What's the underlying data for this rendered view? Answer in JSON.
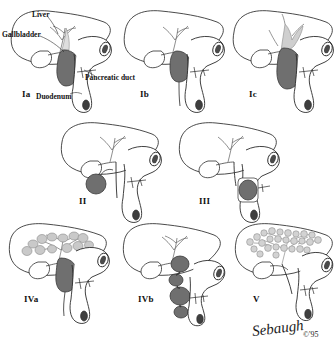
{
  "figure": {
    "colors": {
      "ink": "#2b2b2b",
      "paper": "#ffffff",
      "cyst_dark": "#6f6f6f",
      "cyst_mid": "#8c8c8c",
      "cyst_light": "#c9c9c9",
      "duct_light": "#d8d8d8",
      "liver_fill": "#ffffff"
    }
  },
  "anatomy_labels": [
    {
      "id": "liver",
      "text": "Liver",
      "x": 32,
      "y": 11
    },
    {
      "id": "gallbladder",
      "text": "Gallbladder",
      "x": 2,
      "y": 31
    },
    {
      "id": "pancreatic_duct",
      "text": "Pancreatic duct",
      "x": 85,
      "y": 74
    },
    {
      "id": "duodenum",
      "text": "Duodenum",
      "x": 36,
      "y": 93
    }
  ],
  "panels": [
    {
      "id": "Ia",
      "label": "Ia",
      "label_x": 22,
      "label_y": 90,
      "type": "fusiform-common-bile-duct-cyst",
      "cyst_count": 1,
      "intrahepatic_cysts": 0
    },
    {
      "id": "Ib",
      "label": "Ib",
      "label_x": 140,
      "label_y": 90,
      "type": "focal-segmental-dilatation",
      "cyst_count": 1,
      "intrahepatic_cysts": 0
    },
    {
      "id": "Ic",
      "label": "Ic",
      "label_x": 249,
      "label_y": 90,
      "type": "fusiform-dilatation-extending-intrahepatic",
      "cyst_count": 1,
      "intrahepatic_cysts": 0
    },
    {
      "id": "II",
      "label": "II",
      "label_x": 79,
      "label_y": 197,
      "type": "extrahepatic-diverticulum",
      "cyst_count": 1,
      "intrahepatic_cysts": 0
    },
    {
      "id": "III",
      "label": "III",
      "label_x": 199,
      "label_y": 197,
      "type": "choledochocele",
      "cyst_count": 1,
      "intrahepatic_cysts": 0
    },
    {
      "id": "IVa",
      "label": "IVa",
      "label_x": 24,
      "label_y": 295,
      "type": "multiple-intrahepatic-and-extrahepatic-cysts",
      "cyst_count": 1,
      "intrahepatic_cysts": 12
    },
    {
      "id": "IVb",
      "label": "IVb",
      "label_x": 138,
      "label_y": 295,
      "type": "multiple-extrahepatic-cysts",
      "cyst_count": 4,
      "intrahepatic_cysts": 0
    },
    {
      "id": "V",
      "label": "V",
      "label_x": 253,
      "label_y": 295,
      "type": "caroli-disease-intrahepatic-only",
      "cyst_count": 0,
      "intrahepatic_cysts": 26
    }
  ],
  "credit": {
    "signature": "Sebaugh",
    "copyright": "©'95"
  }
}
